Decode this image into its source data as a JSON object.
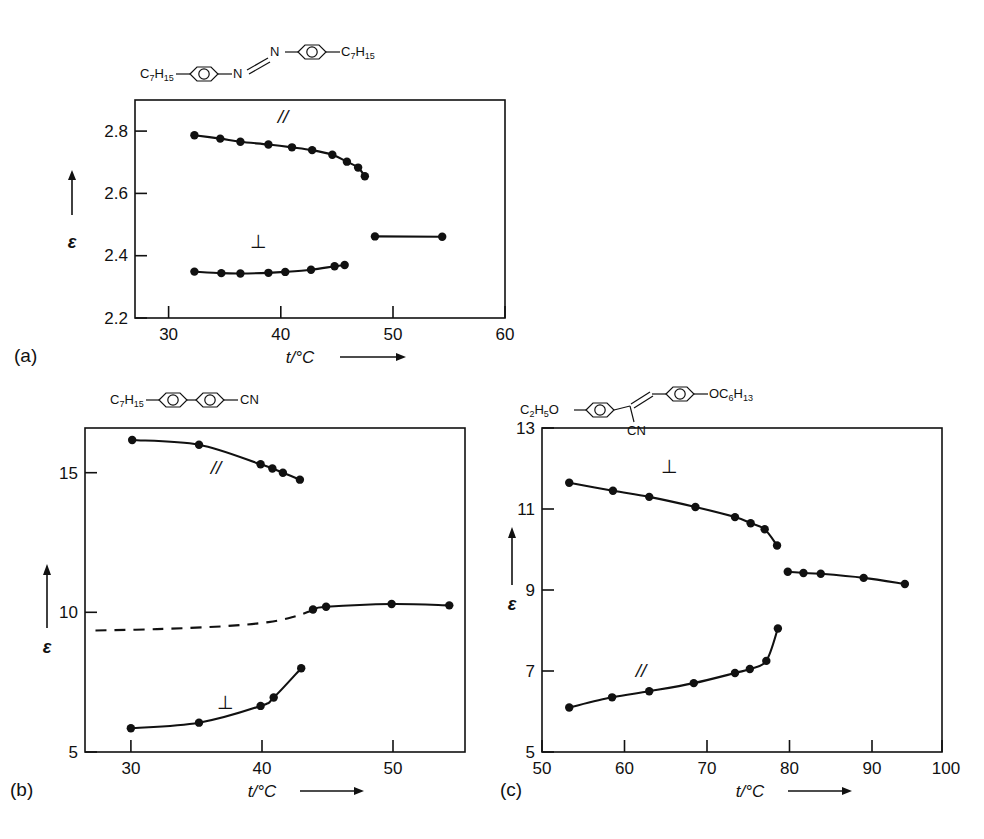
{
  "figure": {
    "axis_label_x": "t/°C",
    "axis_label_y": "ε",
    "panel_a_label": "(a)",
    "panel_b_label": "(b)",
    "panel_c_label": "(c)",
    "parallel_symbol": "//",
    "perpendicular_symbol": "⊥"
  },
  "structures": {
    "a": {
      "name": "4,4'-diheptylazobenzene",
      "left_group": "C7H15",
      "right_group": "C7H15",
      "linker": "N=N",
      "atom_left": "N",
      "atom_right": "N"
    },
    "b": {
      "name": "7CB",
      "left_group": "C7H15",
      "right_group": "CN"
    },
    "c": {
      "name": "alpha-cyanostilbene",
      "left_group": "C2H5O",
      "right_group": "OC6H13",
      "linker_group": "CN"
    }
  },
  "chart_data": [
    {
      "id": "a",
      "type": "scatter",
      "panel": "(a)",
      "title": "",
      "xlabel": "t/°C",
      "ylabel": "ε",
      "xlim": [
        27,
        60
      ],
      "ylim": [
        2.2,
        2.9
      ],
      "xticks": [
        30,
        40,
        50,
        60
      ],
      "yticks": [
        2.2,
        2.4,
        2.6,
        2.8
      ],
      "grid": false,
      "series": [
        {
          "name": "//",
          "label_x": 40.2,
          "label_y": 2.825,
          "x": [
            32.3,
            34.6,
            36.4,
            38.9,
            41.0,
            42.8,
            44.6,
            45.9,
            46.9
          ],
          "y": [
            2.787,
            2.776,
            2.766,
            2.757,
            2.748,
            2.739,
            2.724,
            2.702,
            2.683
          ],
          "tail_x": [
            47.5
          ],
          "tail_y": [
            2.655
          ]
        },
        {
          "name": "⊥",
          "label_x": 38.0,
          "label_y": 2.425,
          "x": [
            32.3,
            34.7,
            36.4,
            38.9,
            40.4,
            42.7,
            44.8,
            45.7
          ],
          "y": [
            2.349,
            2.344,
            2.343,
            2.345,
            2.348,
            2.355,
            2.366,
            2.37
          ]
        },
        {
          "name": "isotropic",
          "label_x": null,
          "label_y": null,
          "x": [
            48.4,
            54.4
          ],
          "y": [
            2.462,
            2.461
          ]
        }
      ]
    },
    {
      "id": "b",
      "type": "scatter",
      "panel": "(b)",
      "title": "",
      "xlabel": "t/°C",
      "ylabel": "ε",
      "xlim": [
        26.5,
        55.5
      ],
      "ylim": [
        5,
        16.6
      ],
      "xticks": [
        30,
        40,
        50
      ],
      "yticks": [
        5,
        10,
        15
      ],
      "grid": false,
      "series": [
        {
          "name": "//",
          "label_x": 36.5,
          "label_y": 14.95,
          "x": [
            30.1,
            35.2,
            39.9,
            40.8,
            41.6,
            42.9
          ],
          "y": [
            16.17,
            16.0,
            15.3,
            15.15,
            15.0,
            14.75
          ]
        },
        {
          "name": "⊥",
          "label_x": 37.2,
          "label_y": 6.55,
          "x": [
            30.0,
            35.2,
            39.9,
            40.9,
            43.0
          ],
          "y": [
            5.85,
            6.05,
            6.65,
            6.95,
            8.0
          ]
        },
        {
          "name": "isotropic",
          "label_x": null,
          "label_y": null,
          "x": [
            43.9,
            44.9,
            49.9,
            54.3
          ],
          "y": [
            10.1,
            10.2,
            10.3,
            10.25
          ]
        },
        {
          "name": "mean-dashed",
          "label_x": null,
          "label_y": null,
          "x": [
            27.3,
            32.0,
            37.0,
            40.5,
            42.5,
            43.7
          ],
          "y": [
            9.35,
            9.4,
            9.5,
            9.65,
            9.85,
            10.05
          ]
        }
      ]
    },
    {
      "id": "c",
      "type": "scatter",
      "panel": "(c)",
      "title": "",
      "xlabel": "t/°C",
      "ylabel": "ε",
      "xlim": [
        52,
        100.5
      ],
      "ylim": [
        5,
        13
      ],
      "xticks": [
        50,
        60,
        70,
        80,
        90,
        100
      ],
      "yticks": [
        5,
        7,
        9,
        11,
        13
      ],
      "grid": false,
      "series": [
        {
          "name": "⊥",
          "label_x": 67.5,
          "label_y": 11.9,
          "x": [
            55.3,
            60.6,
            65.0,
            70.6,
            75.4,
            77.3,
            79.0,
            80.5
          ],
          "y": [
            11.65,
            11.45,
            11.3,
            11.05,
            10.8,
            10.65,
            10.5,
            10.1
          ]
        },
        {
          "name": "//",
          "label_x": 64.0,
          "label_y": 6.85,
          "x": [
            55.3,
            60.5,
            65.0,
            70.4,
            75.4,
            77.2,
            79.2,
            80.6
          ],
          "y": [
            6.1,
            6.35,
            6.5,
            6.7,
            6.95,
            7.05,
            7.25,
            8.05
          ]
        },
        {
          "name": "isotropic",
          "label_x": null,
          "label_y": null,
          "x": [
            81.8,
            83.7,
            85.8,
            91.0,
            96.0
          ],
          "y": [
            9.45,
            9.42,
            9.4,
            9.3,
            9.15
          ]
        }
      ]
    }
  ]
}
